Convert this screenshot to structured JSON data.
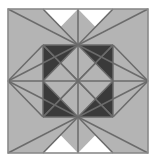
{
  "figure": {
    "name": "quilt-block-pattern",
    "canvas": {
      "width": 157,
      "height": 161
    },
    "background_color": "#ffffff"
  },
  "frame": {
    "x": 8,
    "y": 9,
    "width": 140,
    "height": 144,
    "stroke_color": "#8a8a8a",
    "stroke_width": 1.6,
    "fill_color": "#ffffff"
  },
  "grid": {
    "columns": 4,
    "rows": 4,
    "cell_width": 35,
    "cell_height": 36
  },
  "palette": {
    "white": "#ffffff",
    "light_gray": "#e4e4e4",
    "medium_gray": "#b4b4b4",
    "mid_gray": "#c9c9c9",
    "dark_charcoal": "#3a3a3a",
    "line": "#6b6b6b"
  },
  "line_style": {
    "stroke_color": "#6b6b6b",
    "stroke_width": 1.5
  },
  "shapes": [
    {
      "id": "tl-corner-tri-a",
      "name": "top-left-star-point-upper",
      "fill": "medium_gray",
      "points": "8,9 78,44 43,9"
    },
    {
      "id": "tl-corner-tri-b",
      "name": "top-left-star-point-left",
      "fill": "medium_gray",
      "points": "8,9 8,81 78,44"
    },
    {
      "id": "tr-corner-tri-a",
      "name": "top-right-star-point-upper",
      "fill": "medium_gray",
      "points": "148,9 78,44 113,9"
    },
    {
      "id": "tr-corner-tri-b",
      "name": "top-right-star-point-right",
      "fill": "medium_gray",
      "points": "148,9 148,81 78,44"
    },
    {
      "id": "bl-corner-tri-a",
      "name": "bottom-left-star-point-lower",
      "fill": "medium_gray",
      "points": "8,153 78,118 43,153"
    },
    {
      "id": "bl-corner-tri-b",
      "name": "bottom-left-star-point-left",
      "fill": "medium_gray",
      "points": "8,153 8,81 78,118"
    },
    {
      "id": "br-corner-tri-a",
      "name": "bottom-right-star-point-lower",
      "fill": "medium_gray",
      "points": "148,153 78,118 113,153"
    },
    {
      "id": "br-corner-tri-b",
      "name": "bottom-right-star-point-right",
      "fill": "medium_gray",
      "points": "148,153 148,81 78,118"
    },
    {
      "id": "top-diamond-left",
      "name": "top-center-diamond-left-half",
      "fill": "medium_gray",
      "points": "78,9 43,45 78,45"
    },
    {
      "id": "top-diamond-right",
      "name": "top-center-diamond-right-half",
      "fill": "medium_gray",
      "points": "78,9 113,45 78,45"
    },
    {
      "id": "bottom-diamond-left",
      "name": "bottom-center-diamond-left-half",
      "fill": "medium_gray",
      "points": "78,153 43,117 78,117"
    },
    {
      "id": "bottom-diamond-right",
      "name": "bottom-center-diamond-right-half",
      "fill": "medium_gray",
      "points": "78,153 113,117 78,117"
    },
    {
      "id": "left-diamond-top",
      "name": "left-center-diamond-top-half",
      "fill": "medium_gray",
      "points": "8,81 44,46 44,81"
    },
    {
      "id": "left-diamond-bottom",
      "name": "left-center-diamond-bottom-half",
      "fill": "medium_gray",
      "points": "8,81 44,116 44,81"
    },
    {
      "id": "right-diamond-top",
      "name": "right-center-diamond-top-half",
      "fill": "medium_gray",
      "points": "148,81 112,46 112,81"
    },
    {
      "id": "right-diamond-bottom",
      "name": "right-center-diamond-bottom-half",
      "fill": "medium_gray",
      "points": "148,81 112,116 112,81"
    },
    {
      "id": "inner-tl-up",
      "name": "inner-top-left-triangle-upper",
      "fill": "light_gray",
      "points": "43,45 78,45 60,63"
    },
    {
      "id": "inner-tl-left",
      "name": "inner-top-left-triangle-left",
      "fill": "light_gray",
      "points": "43,45 43,81 60,63"
    },
    {
      "id": "inner-tl-down",
      "name": "inner-top-left-triangle-lower",
      "fill": "light_gray",
      "points": "43,81 78,81 60,63"
    },
    {
      "id": "inner-tl-right",
      "name": "inner-top-left-triangle-right",
      "fill": "mid_gray",
      "points": "78,45 78,81 60,63"
    },
    {
      "id": "inner-tr-up",
      "name": "inner-top-right-triangle-upper",
      "fill": "light_gray",
      "points": "78,45 113,45 96,63"
    },
    {
      "id": "inner-tr-right",
      "name": "inner-top-right-triangle-right",
      "fill": "light_gray",
      "points": "113,45 113,81 96,63"
    },
    {
      "id": "inner-tr-down",
      "name": "inner-top-right-triangle-lower",
      "fill": "light_gray",
      "points": "78,81 113,81 96,63"
    },
    {
      "id": "inner-tr-left",
      "name": "inner-top-right-triangle-left",
      "fill": "mid_gray",
      "points": "78,45 78,81 96,63"
    },
    {
      "id": "inner-bl-up",
      "name": "inner-bottom-left-triangle-upper",
      "fill": "light_gray",
      "points": "43,81 78,81 60,99"
    },
    {
      "id": "inner-bl-left",
      "name": "inner-bottom-left-triangle-left",
      "fill": "light_gray",
      "points": "43,81 43,117 60,99"
    },
    {
      "id": "inner-bl-down",
      "name": "inner-bottom-left-triangle-lower",
      "fill": "light_gray",
      "points": "43,117 78,117 60,99"
    },
    {
      "id": "inner-bl-right",
      "name": "inner-bottom-left-triangle-right",
      "fill": "mid_gray",
      "points": "78,81 78,117 60,99"
    },
    {
      "id": "inner-br-up",
      "name": "inner-bottom-right-triangle-upper",
      "fill": "light_gray",
      "points": "78,81 113,81 96,99"
    },
    {
      "id": "inner-br-right",
      "name": "inner-bottom-right-triangle-right",
      "fill": "light_gray",
      "points": "113,81 113,117 96,99"
    },
    {
      "id": "inner-br-down",
      "name": "inner-bottom-right-triangle-lower",
      "fill": "light_gray",
      "points": "78,117 113,117 96,99"
    },
    {
      "id": "inner-br-left",
      "name": "inner-bottom-right-triangle-left",
      "fill": "mid_gray",
      "points": "78,81 78,117 96,99"
    },
    {
      "id": "center-square",
      "name": "center-dark-square",
      "fill": "dark_charcoal",
      "points": "43,45 113,45 113,117 43,117"
    },
    {
      "id": "center-diamond",
      "name": "center-light-diamond",
      "fill": "medium_gray",
      "points": "78,45 113,81 78,117 43,81"
    }
  ],
  "lines": [
    {
      "name": "grid-line-vertical-1",
      "x1": 43,
      "y1": 45,
      "x2": 43,
      "y2": 117
    },
    {
      "name": "grid-line-vertical-2",
      "x1": 78,
      "y1": 9,
      "x2": 78,
      "y2": 153
    },
    {
      "name": "grid-line-vertical-3",
      "x1": 113,
      "y1": 45,
      "x2": 113,
      "y2": 117
    },
    {
      "name": "grid-line-horizontal-1",
      "x1": 43,
      "y1": 45,
      "x2": 113,
      "y2": 45
    },
    {
      "name": "grid-line-horizontal-2",
      "x1": 8,
      "y1": 81,
      "x2": 148,
      "y2": 81
    },
    {
      "name": "grid-line-horizontal-3",
      "x1": 43,
      "y1": 117,
      "x2": 113,
      "y2": 117
    },
    {
      "name": "diag-tl-outer-a",
      "x1": 8,
      "y1": 9,
      "x2": 78,
      "y2": 45
    },
    {
      "name": "diag-tl-outer-b",
      "x1": 43,
      "y1": 9,
      "x2": 78,
      "y2": 45
    },
    {
      "name": "diag-tl-outer-c",
      "x1": 8,
      "y1": 81,
      "x2": 78,
      "y2": 45
    },
    {
      "name": "diag-tr-outer-a",
      "x1": 148,
      "y1": 9,
      "x2": 78,
      "y2": 45
    },
    {
      "name": "diag-tr-outer-b",
      "x1": 113,
      "y1": 9,
      "x2": 78,
      "y2": 45
    },
    {
      "name": "diag-tr-outer-c",
      "x1": 148,
      "y1": 81,
      "x2": 78,
      "y2": 45
    },
    {
      "name": "diag-bl-outer-a",
      "x1": 8,
      "y1": 153,
      "x2": 78,
      "y2": 117
    },
    {
      "name": "diag-bl-outer-b",
      "x1": 43,
      "y1": 153,
      "x2": 78,
      "y2": 117
    },
    {
      "name": "diag-bl-outer-c",
      "x1": 8,
      "y1": 81,
      "x2": 78,
      "y2": 117
    },
    {
      "name": "diag-br-outer-a",
      "x1": 148,
      "y1": 153,
      "x2": 78,
      "y2": 117
    },
    {
      "name": "diag-br-outer-b",
      "x1": 113,
      "y1": 153,
      "x2": 78,
      "y2": 117
    },
    {
      "name": "diag-br-outer-c",
      "x1": 148,
      "y1": 81,
      "x2": 78,
      "y2": 117
    },
    {
      "name": "diag-left-diamond-top",
      "x1": 8,
      "y1": 81,
      "x2": 43,
      "y2": 45
    },
    {
      "name": "diag-left-diamond-bottom",
      "x1": 8,
      "y1": 81,
      "x2": 43,
      "y2": 117
    },
    {
      "name": "diag-right-diamond-top",
      "x1": 148,
      "y1": 81,
      "x2": 113,
      "y2": 45
    },
    {
      "name": "diag-right-diamond-bottom",
      "x1": 148,
      "y1": 81,
      "x2": 113,
      "y2": 117
    },
    {
      "name": "diag-center-tl",
      "x1": 43,
      "y1": 45,
      "x2": 78,
      "y2": 81
    },
    {
      "name": "diag-center-tr",
      "x1": 113,
      "y1": 45,
      "x2": 78,
      "y2": 81
    },
    {
      "name": "diag-center-bl",
      "x1": 43,
      "y1": 117,
      "x2": 78,
      "y2": 81
    },
    {
      "name": "diag-center-br",
      "x1": 113,
      "y1": 117,
      "x2": 78,
      "y2": 81
    },
    {
      "name": "diag-inner-tl-a",
      "x1": 43,
      "y1": 45,
      "x2": 78,
      "y2": 81
    },
    {
      "name": "diag-inner-tl-b",
      "x1": 78,
      "y1": 45,
      "x2": 43,
      "y2": 81
    },
    {
      "name": "diag-inner-tr-a",
      "x1": 78,
      "y1": 45,
      "x2": 113,
      "y2": 81
    },
    {
      "name": "diag-inner-tr-b",
      "x1": 113,
      "y1": 45,
      "x2": 78,
      "y2": 81
    },
    {
      "name": "diag-inner-bl-a",
      "x1": 43,
      "y1": 81,
      "x2": 78,
      "y2": 117
    },
    {
      "name": "diag-inner-bl-b",
      "x1": 78,
      "y1": 81,
      "x2": 43,
      "y2": 117
    },
    {
      "name": "diag-inner-br-a",
      "x1": 78,
      "y1": 81,
      "x2": 113,
      "y2": 117
    },
    {
      "name": "diag-inner-br-b",
      "x1": 113,
      "y1": 81,
      "x2": 78,
      "y2": 117
    }
  ]
}
